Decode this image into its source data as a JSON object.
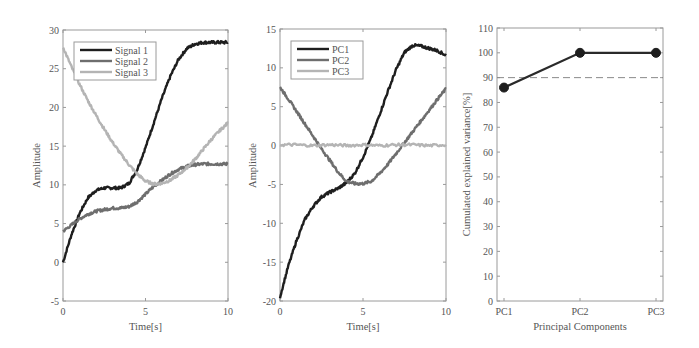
{
  "chart_data": [
    {
      "type": "line",
      "title": "",
      "xlabel": "Time[s]",
      "ylabel": "Amplitude",
      "xlim": [
        0,
        10
      ],
      "ylim": [
        -5,
        30
      ],
      "xticks": [
        0,
        5,
        10
      ],
      "yticks": [
        -5,
        0,
        5,
        10,
        15,
        20,
        25,
        30
      ],
      "grid": false,
      "legend_position": "upper-left",
      "series": [
        {
          "name": "Signal 1",
          "color": "#1e1e1e",
          "x": [
            0,
            0.5,
            1,
            1.5,
            2,
            2.5,
            3,
            3.5,
            4,
            4.5,
            5,
            5.5,
            6,
            6.5,
            7,
            7.5,
            8,
            8.5,
            9,
            9.5,
            10
          ],
          "y": [
            0,
            3.5,
            6.3,
            8.3,
            9.3,
            9.6,
            9.6,
            9.6,
            10.2,
            12.0,
            14.8,
            18.0,
            21.2,
            24.0,
            26.2,
            27.6,
            28.2,
            28.4,
            28.4,
            28.4,
            28.4
          ]
        },
        {
          "name": "Signal 2",
          "color": "#6e6e6e",
          "x": [
            0,
            0.5,
            1,
            1.5,
            2,
            2.5,
            3,
            3.5,
            4,
            4.5,
            5,
            5.5,
            6,
            6.5,
            7,
            7.5,
            8,
            8.5,
            9,
            9.5,
            10
          ],
          "y": [
            4.0,
            4.8,
            5.6,
            6.2,
            6.6,
            6.8,
            7.0,
            7.0,
            7.2,
            7.8,
            8.8,
            9.8,
            10.6,
            11.4,
            12.0,
            12.4,
            12.6,
            12.7,
            12.7,
            12.7,
            12.7
          ]
        },
        {
          "name": "Signal 3",
          "color": "#b4b4b4",
          "x": [
            0,
            0.5,
            1,
            1.5,
            2,
            2.5,
            3,
            3.5,
            4,
            4.5,
            5,
            5.5,
            6,
            6.5,
            7,
            7.5,
            8,
            8.5,
            9,
            9.5,
            10
          ],
          "y": [
            27.8,
            25.3,
            23.0,
            20.9,
            19.0,
            17.2,
            15.5,
            14.0,
            12.6,
            11.4,
            10.5,
            10.1,
            10.2,
            10.6,
            11.3,
            12.2,
            13.3,
            14.6,
            15.9,
            17.0,
            18.0
          ]
        }
      ]
    },
    {
      "type": "line",
      "title": "",
      "xlabel": "Time[s]",
      "ylabel": "Amplitude",
      "xlim": [
        0,
        10
      ],
      "ylim": [
        -20,
        15
      ],
      "xticks": [
        0,
        5,
        10
      ],
      "yticks": [
        -20,
        -15,
        -10,
        -5,
        0,
        5,
        10,
        15
      ],
      "grid": false,
      "legend_position": "upper-left",
      "series": [
        {
          "name": "PC1",
          "color": "#1e1e1e",
          "x": [
            0,
            0.5,
            1,
            1.5,
            2,
            2.5,
            3,
            3.5,
            4,
            4.5,
            5,
            5.5,
            6,
            6.5,
            7,
            7.5,
            8,
            8.5,
            9,
            9.5,
            10
          ],
          "y": [
            -19.5,
            -15.5,
            -12.2,
            -9.5,
            -7.8,
            -6.6,
            -6.0,
            -5.5,
            -4.8,
            -3.6,
            -1.5,
            1.0,
            4.0,
            7.0,
            9.8,
            12.0,
            12.9,
            12.8,
            12.5,
            12.2,
            11.6
          ]
        },
        {
          "name": "PC2",
          "color": "#6e6e6e",
          "x": [
            0,
            0.5,
            1,
            1.5,
            2,
            2.5,
            3,
            3.5,
            4,
            4.5,
            5,
            5.5,
            6,
            6.5,
            7,
            7.5,
            8,
            8.5,
            9,
            9.5,
            10
          ],
          "y": [
            7.5,
            6.0,
            4.4,
            2.8,
            1.2,
            -0.4,
            -1.9,
            -3.4,
            -4.6,
            -4.9,
            -4.9,
            -4.6,
            -3.6,
            -2.4,
            -1.0,
            0.4,
            1.8,
            3.2,
            4.6,
            6.0,
            7.3
          ]
        },
        {
          "name": "PC3",
          "color": "#b4b4b4",
          "x": [
            0,
            1,
            2,
            3,
            4,
            5,
            6,
            7,
            8,
            9,
            10
          ],
          "y": [
            0.1,
            0.1,
            0.0,
            0.1,
            0.0,
            0.1,
            0.0,
            0.1,
            0.1,
            0.0,
            0.1
          ]
        }
      ]
    },
    {
      "type": "line",
      "title": "",
      "xlabel": "Principal Components",
      "ylabel": "Cumulated explained variance[%]",
      "categories": [
        "PC1",
        "PC2",
        "PC3"
      ],
      "ylim": [
        0,
        110
      ],
      "yticks": [
        0,
        10,
        20,
        30,
        40,
        50,
        60,
        70,
        80,
        90,
        100,
        110
      ],
      "grid": false,
      "series": [
        {
          "name": "Cumulated explained variance",
          "color": "#2a2a2a",
          "marker": "circle",
          "values": [
            86,
            100,
            100
          ]
        }
      ],
      "annotations": [
        {
          "type": "hline",
          "y": 90,
          "style": "dashed",
          "color": "#8a8a8a",
          "label": "90% threshold"
        }
      ]
    }
  ],
  "panels": [
    {
      "xlabel": "Time[s]",
      "ylabel": "Amplitude"
    },
    {
      "xlabel": "Time[s]",
      "ylabel": "Amplitude"
    },
    {
      "xlabel": "Principal Components",
      "ylabel": "Cumulated explained variance[%]"
    }
  ]
}
